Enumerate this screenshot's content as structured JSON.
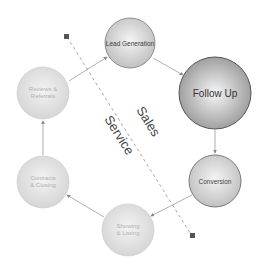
{
  "diagram": {
    "type": "cycle",
    "nodes": [
      {
        "id": "lead",
        "label_lines": [
          "Lead Generation"
        ],
        "emphasis": "normal"
      },
      {
        "id": "follow",
        "label_lines": [
          "Follow Up"
        ],
        "emphasis": "high"
      },
      {
        "id": "conversion",
        "label_lines": [
          "Conversion"
        ],
        "emphasis": "normal"
      },
      {
        "id": "showing",
        "label_lines": [
          "Showing",
          "& Listing"
        ],
        "emphasis": "faded"
      },
      {
        "id": "contracts",
        "label_lines": [
          "Contracts",
          "& Closing"
        ],
        "emphasis": "faded"
      },
      {
        "id": "reviews",
        "label_lines": [
          "Reviews &",
          "Referrals"
        ],
        "emphasis": "faded"
      }
    ],
    "edges": [
      {
        "from": "lead",
        "to": "follow"
      },
      {
        "from": "follow",
        "to": "conversion"
      },
      {
        "from": "conversion",
        "to": "showing"
      },
      {
        "from": "showing",
        "to": "contracts"
      },
      {
        "from": "contracts",
        "to": "reviews"
      },
      {
        "from": "reviews",
        "to": "lead"
      }
    ],
    "divider": {
      "style": "dashed",
      "labels": {
        "upper_right": "Sales",
        "lower_left": "Service"
      }
    },
    "colors": {
      "node_fill_light": "#e6e6e6",
      "node_fill_mid": "#bdbdbd",
      "node_stroke": "#8a8a8a",
      "follow_fill_center": "#f2f2f2",
      "follow_fill_edge": "#9a9a9a",
      "follow_stroke": "#555555",
      "arrow": "#9a9a9a",
      "divider": "#a0a0a0",
      "divider_end": "#555555",
      "text_dark": "#333333",
      "text_faded": "#b8b8b8",
      "side_label": "#444444"
    }
  }
}
